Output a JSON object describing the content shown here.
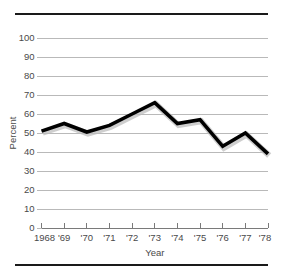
{
  "chart_data": {
    "type": "line",
    "title": "",
    "xlabel": "Year",
    "ylabel": "Percent",
    "categories": [
      "1968",
      "'69",
      "'70",
      "'71",
      "'72",
      "'73",
      "'74",
      "'75",
      "'76",
      "'77",
      "'78"
    ],
    "x": [
      1968,
      1969,
      1970,
      1971,
      1972,
      1973,
      1974,
      1975,
      1976,
      1977,
      1978
    ],
    "values": [
      51,
      55,
      50.5,
      54,
      60,
      66,
      55,
      57,
      43,
      50,
      39
    ],
    "series": [
      {
        "name": "Percent",
        "values": [
          51,
          55,
          50.5,
          54,
          60,
          66,
          55,
          57,
          43,
          50,
          39
        ]
      }
    ],
    "ylim": [
      0,
      100
    ],
    "yticks": [
      0,
      10,
      20,
      30,
      40,
      50,
      60,
      70,
      80,
      90,
      100
    ],
    "ytick_labels": [
      "0",
      "10",
      "20",
      "30",
      "40",
      "50",
      "60",
      "70",
      "80",
      "90",
      "100"
    ],
    "xtick_labels": [
      "1968",
      "'69",
      "'70",
      "'71",
      "'72",
      "'73",
      "'74",
      "'75",
      "'76",
      "'77",
      "'78"
    ],
    "grid": true,
    "legend": "none",
    "line_color": "#000000",
    "shadow_color": "#bdbdbd",
    "grid_color": "#b9b9b9",
    "axis_color": "#7a7a7a",
    "rule_color": "#1a1a1a",
    "background": "#ffffff",
    "annotations": []
  },
  "figure": {
    "rule_top_label": "top-rule",
    "rule_bottom_label": "bottom-rule"
  }
}
